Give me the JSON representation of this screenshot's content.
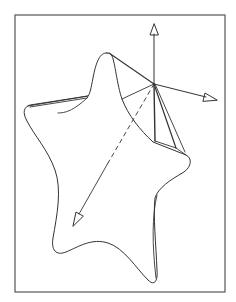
{
  "figure": {
    "type": "line-drawing",
    "colors": {
      "background": "#ffffff",
      "line": "#333333",
      "frame": "#555555"
    },
    "frame": {
      "x": 15,
      "y": 15,
      "width": 210,
      "height": 277
    },
    "apex": {
      "x": 154,
      "y": 84
    },
    "axes": [
      {
        "name": "vertical-axis",
        "from": [
          154,
          84
        ],
        "to": [
          154,
          24
        ],
        "style": "solid",
        "arrowhead": "open"
      },
      {
        "name": "right-axis",
        "from": [
          154,
          84
        ],
        "to": [
          217,
          100
        ],
        "style": "solid",
        "arrowhead": "open"
      },
      {
        "name": "depth-axis",
        "from": [
          154,
          84
        ],
        "to": [
          73,
          226
        ],
        "style": "dashed-then-solid",
        "arrowhead": "open"
      }
    ],
    "star_tips": [
      {
        "name": "top",
        "x": 107,
        "y": 53
      },
      {
        "name": "left",
        "x": 25,
        "y": 107
      },
      {
        "name": "right",
        "x": 188,
        "y": 158
      },
      {
        "name": "bottom-left",
        "x": 55,
        "y": 252
      },
      {
        "name": "bottom-right",
        "x": 155,
        "y": 282
      }
    ],
    "labels": []
  }
}
